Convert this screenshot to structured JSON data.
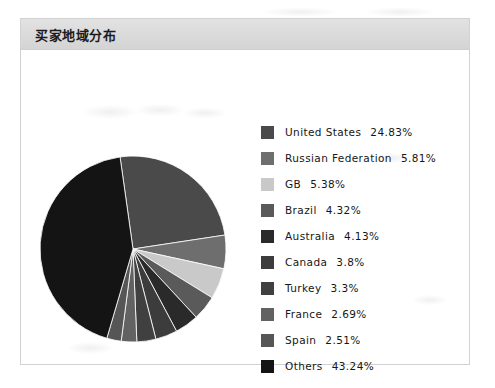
{
  "panel": {
    "title": "买家地域分布"
  },
  "chart_data": {
    "type": "pie",
    "title": "买家地域分布",
    "legend_position": "right",
    "grid": false,
    "categories": [
      "United States",
      "Russian Federation",
      "GB",
      "Brazil",
      "Australia",
      "Canada",
      "Turkey",
      "France",
      "Spain",
      "Others"
    ],
    "values": [
      24.83,
      5.81,
      5.38,
      4.32,
      4.13,
      3.8,
      3.3,
      2.69,
      2.51,
      43.24
    ],
    "value_labels": [
      "24.83%",
      "5.81%",
      "5.38%",
      "4.32%",
      "4.13%",
      "3.8%",
      "3.3%",
      "2.69%",
      "2.51%",
      "43.24%"
    ],
    "unit": "%",
    "colors": [
      "#4a4a4a",
      "#6e6e6e",
      "#c9c9c9",
      "#5a5a5a",
      "#2a2a2a",
      "#3c3c3c",
      "#404040",
      "#626262",
      "#565656",
      "#141414"
    ]
  },
  "legend": {
    "items": [
      {
        "label": "United States",
        "value": "24.83%",
        "color": "#4a4a4a"
      },
      {
        "label": "Russian Federation",
        "value": "5.81%",
        "color": "#6e6e6e"
      },
      {
        "label": "GB",
        "value": "5.38%",
        "color": "#c9c9c9"
      },
      {
        "label": "Brazil",
        "value": "4.32%",
        "color": "#5a5a5a"
      },
      {
        "label": "Australia",
        "value": "4.13%",
        "color": "#2a2a2a"
      },
      {
        "label": "Canada",
        "value": "3.8%",
        "color": "#3c3c3c"
      },
      {
        "label": "Turkey",
        "value": "3.3%",
        "color": "#404040"
      },
      {
        "label": "France",
        "value": "2.69%",
        "color": "#626262"
      },
      {
        "label": "Spain",
        "value": "2.51%",
        "color": "#565656"
      },
      {
        "label": "Others",
        "value": "43.24%",
        "color": "#141414"
      }
    ]
  }
}
